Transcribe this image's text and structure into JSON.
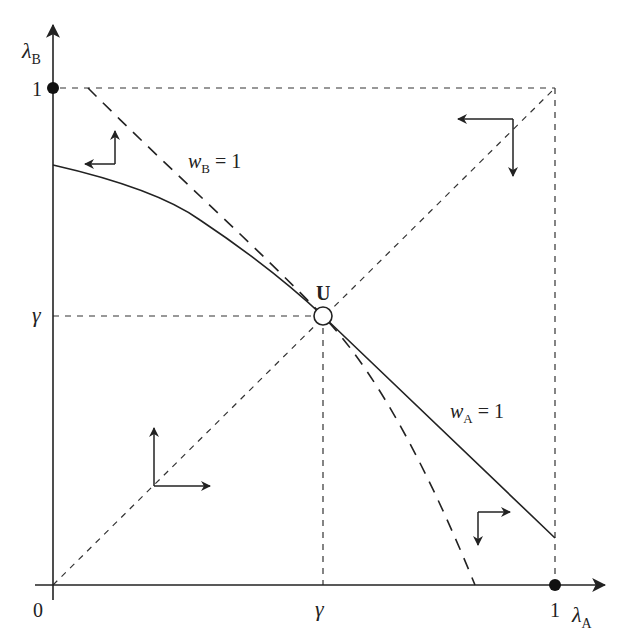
{
  "diagram": {
    "type": "phase-diagram",
    "axes": {
      "x_label_main": "λ",
      "x_label_sub": "A",
      "y_label_main": "λ",
      "y_label_sub": "B",
      "origin_label": "0",
      "x_tick_gamma": "γ",
      "x_tick_one": "1",
      "y_tick_gamma": "γ",
      "y_tick_one": "1"
    },
    "curves": {
      "wA": {
        "label_main": "w",
        "label_sub": "A",
        "label_rest": " = 1",
        "style": "solid"
      },
      "wB": {
        "label_main": "w",
        "label_sub": "B",
        "label_rest": " = 1",
        "style": "dashed"
      }
    },
    "points": {
      "U": {
        "label": "U",
        "style": "open-circle"
      },
      "corner_x1": {
        "style": "filled-circle"
      },
      "corner_y1": {
        "style": "filled-circle"
      }
    },
    "direction_arrows": [
      {
        "region": "upper-left",
        "directions": [
          "left",
          "up"
        ]
      },
      {
        "region": "upper-right",
        "directions": [
          "left",
          "down"
        ]
      },
      {
        "region": "lower-left",
        "directions": [
          "right",
          "up"
        ]
      },
      {
        "region": "lower-right",
        "directions": [
          "right",
          "down"
        ]
      }
    ],
    "colors": {
      "ink": "#222222",
      "background": "#ffffff"
    }
  }
}
